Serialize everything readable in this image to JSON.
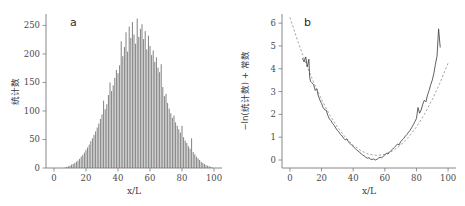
{
  "figure": {
    "background": "#ffffff",
    "bar_color": "#808080",
    "curve_color": "#4d4d4d",
    "fit_color": "#9a9a9a",
    "axis_color": "#7a7a7a"
  },
  "panel_a": {
    "tag": "a",
    "xlabel": "x/L",
    "ylabel": "统计数"
  },
  "panel_b": {
    "tag": "b",
    "xlabel": "x/L",
    "ylabel": "−ln(统计数) + 常数"
  },
  "chart_data": [
    {
      "type": "bar",
      "title": "",
      "panel": "a",
      "xlabel": "x/L",
      "ylabel": "统计数",
      "xlim": [
        -5,
        105
      ],
      "ylim": [
        0,
        270
      ],
      "xticks": [
        0,
        20,
        40,
        60,
        80,
        100
      ],
      "yticks": [
        0,
        50,
        100,
        150,
        200,
        250
      ],
      "grid": false,
      "legend": "none",
      "bar_width": 0.62,
      "x": [
        1,
        2,
        3,
        4,
        5,
        6,
        7,
        8,
        9,
        10,
        11,
        12,
        13,
        14,
        15,
        16,
        17,
        18,
        19,
        20,
        21,
        22,
        23,
        24,
        25,
        26,
        27,
        28,
        29,
        30,
        31,
        32,
        33,
        34,
        35,
        36,
        37,
        38,
        39,
        40,
        41,
        42,
        43,
        44,
        45,
        46,
        47,
        48,
        49,
        50,
        51,
        52,
        53,
        54,
        55,
        56,
        57,
        58,
        59,
        60,
        61,
        62,
        63,
        64,
        65,
        66,
        67,
        68,
        69,
        70,
        71,
        72,
        73,
        74,
        75,
        76,
        77,
        78,
        79,
        80,
        81,
        82,
        83,
        84,
        85,
        86,
        87,
        88,
        89,
        90,
        91,
        92,
        93,
        94,
        95,
        96,
        97,
        98,
        99,
        100
      ],
      "values": [
        0,
        0,
        0,
        0,
        0,
        0,
        1,
        2,
        3,
        4,
        6,
        7,
        9,
        11,
        13,
        16,
        20,
        23,
        27,
        32,
        36,
        41,
        47,
        52,
        58,
        64,
        71,
        78,
        86,
        94,
        118,
        103,
        112,
        128,
        150,
        135,
        145,
        158,
        172,
        166,
        180,
        222,
        196,
        212,
        238,
        204,
        248,
        228,
        256,
        234,
        218,
        262,
        230,
        244,
        252,
        226,
        240,
        208,
        232,
        214,
        198,
        206,
        186,
        194,
        176,
        168,
        182,
        142,
        126,
        130,
        114,
        104,
        96,
        88,
        92,
        80,
        74,
        68,
        62,
        74,
        54,
        48,
        44,
        38,
        34,
        52,
        28,
        24,
        20,
        17,
        14,
        11,
        9,
        7,
        5,
        4,
        3,
        2,
        1,
        0
      ]
    },
    {
      "type": "line",
      "panel": "b",
      "xlabel": "x/L",
      "ylabel": "−ln(统计数) + 常数",
      "xlim": [
        -5,
        105
      ],
      "ylim": [
        -0.35,
        6.4
      ],
      "xticks": [
        0,
        20,
        40,
        60,
        80,
        100
      ],
      "yticks": [
        0,
        1,
        2,
        3,
        4,
        5,
        6
      ],
      "grid": false,
      "legend": "none",
      "series": [
        {
          "name": "data",
          "style": "solid",
          "x": [
            8,
            9,
            10,
            11,
            12,
            12.5,
            13,
            14,
            15,
            16,
            17,
            18,
            19,
            20,
            21,
            22,
            23,
            24,
            25,
            26,
            27,
            28,
            29,
            30,
            31,
            32,
            33,
            34,
            35,
            36,
            37,
            38,
            39,
            40,
            41,
            42,
            43,
            44,
            45,
            46,
            47,
            48,
            49,
            50,
            51,
            52,
            53,
            54,
            55,
            56,
            57,
            58,
            59,
            60,
            61,
            62,
            63,
            64,
            65,
            66,
            67,
            68,
            69,
            70,
            71,
            72,
            73,
            74,
            75,
            76,
            77,
            78,
            79,
            80,
            81,
            82,
            83,
            84,
            85,
            86,
            87,
            88,
            89,
            90,
            91,
            92,
            93,
            94,
            95
          ],
          "values": [
            4.45,
            4.3,
            4.52,
            4.08,
            4.42,
            3.62,
            3.45,
            3.38,
            3.3,
            3.05,
            3.12,
            2.8,
            2.62,
            2.48,
            2.3,
            2.2,
            2.18,
            1.95,
            1.8,
            1.72,
            1.6,
            1.52,
            1.4,
            1.3,
            1.22,
            1.12,
            1.05,
            0.95,
            0.88,
            0.92,
            0.8,
            0.72,
            0.65,
            0.6,
            0.52,
            0.45,
            0.4,
            0.34,
            0.28,
            0.22,
            0.18,
            0.12,
            0.08,
            0.1,
            0.04,
            0.02,
            0.05,
            0.0,
            0.03,
            0.08,
            0.12,
            0.1,
            0.16,
            0.22,
            0.3,
            0.26,
            0.35,
            0.42,
            0.48,
            0.55,
            0.62,
            0.7,
            0.66,
            0.8,
            0.88,
            0.95,
            1.05,
            1.12,
            1.22,
            1.3,
            1.42,
            1.55,
            1.68,
            1.82,
            2.3,
            2.05,
            2.2,
            2.45,
            2.62,
            2.55,
            2.85,
            3.05,
            3.3,
            3.5,
            3.8,
            4.2,
            4.55,
            5.75,
            4.95
          ]
        },
        {
          "name": "parabolic fit",
          "style": "dashed",
          "x": [
            0,
            5,
            10,
            15,
            20,
            25,
            30,
            35,
            40,
            45,
            50,
            55,
            60,
            65,
            70,
            75,
            80,
            85,
            90,
            95,
            100
          ],
          "values": [
            6.25,
            5.2,
            4.25,
            3.4,
            2.65,
            2.0,
            1.45,
            1.0,
            0.65,
            0.4,
            0.25,
            0.2,
            0.25,
            0.4,
            0.65,
            1.0,
            1.45,
            2.0,
            2.65,
            3.4,
            4.25
          ]
        }
      ]
    }
  ]
}
